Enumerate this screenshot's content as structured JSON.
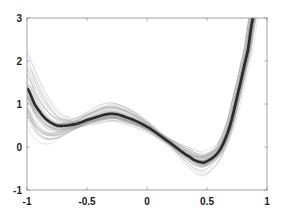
{
  "chart_data": {
    "type": "line",
    "title": "",
    "xlabel": "",
    "ylabel": "",
    "xlim": [
      -1,
      1
    ],
    "ylim": [
      -1,
      3
    ],
    "xticks": [
      -1,
      -0.5,
      0,
      0.5,
      1
    ],
    "yticks": [
      -1,
      0,
      1,
      2,
      3
    ],
    "xtick_labels": [
      "-1",
      "-0.5",
      "0",
      "0.5",
      "1"
    ],
    "ytick_labels": [
      "-1",
      "0",
      "1",
      "2",
      "3"
    ],
    "grid": false,
    "legend": null,
    "series": [
      {
        "name": "mean",
        "style": "thick dark line",
        "color": "#2b2b2b",
        "x": [
          -1.0,
          -0.933,
          -0.85,
          -0.75,
          -0.6,
          -0.5,
          -0.31,
          -0.183,
          0.0,
          0.192,
          0.358,
          0.442,
          0.5,
          0.608,
          0.692,
          0.775,
          0.842,
          0.883
        ],
        "values": [
          1.37,
          0.98,
          0.67,
          0.5,
          0.53,
          0.63,
          0.77,
          0.7,
          0.47,
          0.1,
          -0.23,
          -0.35,
          -0.33,
          -0.07,
          0.5,
          1.44,
          2.26,
          3.0
        ]
      },
      {
        "name": "samples",
        "style": "many thin light-gray lines scattered around the mean",
        "color": "#9a9a9a",
        "count": 60,
        "spread_at_x_minus_1": [
          0.3,
          2.4
        ],
        "spread_at_x_0": [
          0.1,
          1.0
        ],
        "spread_at_x_0_5": [
          -0.6,
          0.6
        ]
      }
    ]
  },
  "colors": {
    "axes": "#8c8c8c",
    "mean_line": "#2b2b2b",
    "sample_line": "#9a9a9a",
    "background": "#ffffff"
  }
}
